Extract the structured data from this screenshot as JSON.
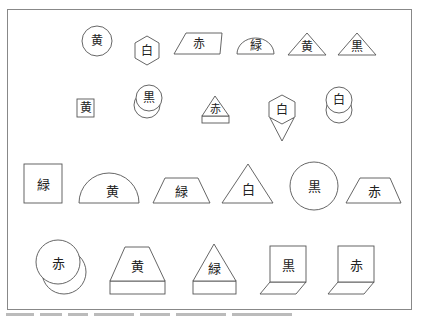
{
  "figure": {
    "type": "shape-label puzzle",
    "rows": [
      {
        "items": [
          {
            "shape": "circle",
            "label": "黄"
          },
          {
            "shape": "hexagon",
            "label": "白"
          },
          {
            "shape": "parallelogram",
            "label": "赤"
          },
          {
            "shape": "semicircle",
            "label": "緑"
          },
          {
            "shape": "triangle",
            "label": "黄"
          },
          {
            "shape": "triangle",
            "label": "黒"
          }
        ]
      },
      {
        "items": [
          {
            "shape": "square",
            "label": "黄"
          },
          {
            "shape": "stacked-circles",
            "label": "黒"
          },
          {
            "shape": "triangle-on-base",
            "label": "赤"
          },
          {
            "shape": "hexagon-with-kite",
            "label": "白"
          },
          {
            "shape": "stacked-circles",
            "label": "白"
          }
        ]
      },
      {
        "items": [
          {
            "shape": "square",
            "label": "緑"
          },
          {
            "shape": "semicircle",
            "label": "黄"
          },
          {
            "shape": "trapezoid",
            "label": "緑"
          },
          {
            "shape": "triangle",
            "label": "白"
          },
          {
            "shape": "circle",
            "label": "黒"
          },
          {
            "shape": "trapezoid",
            "label": "赤"
          }
        ]
      },
      {
        "items": [
          {
            "shape": "stacked-circles",
            "label": "赤"
          },
          {
            "shape": "trapezoid-on-base",
            "label": "黄"
          },
          {
            "shape": "triangle-on-base",
            "label": "緑"
          },
          {
            "shape": "folded-square",
            "label": "黒"
          },
          {
            "shape": "folded-square",
            "label": "赤"
          }
        ]
      }
    ],
    "stroke_color": "#555555",
    "frame_color": "#888888"
  }
}
